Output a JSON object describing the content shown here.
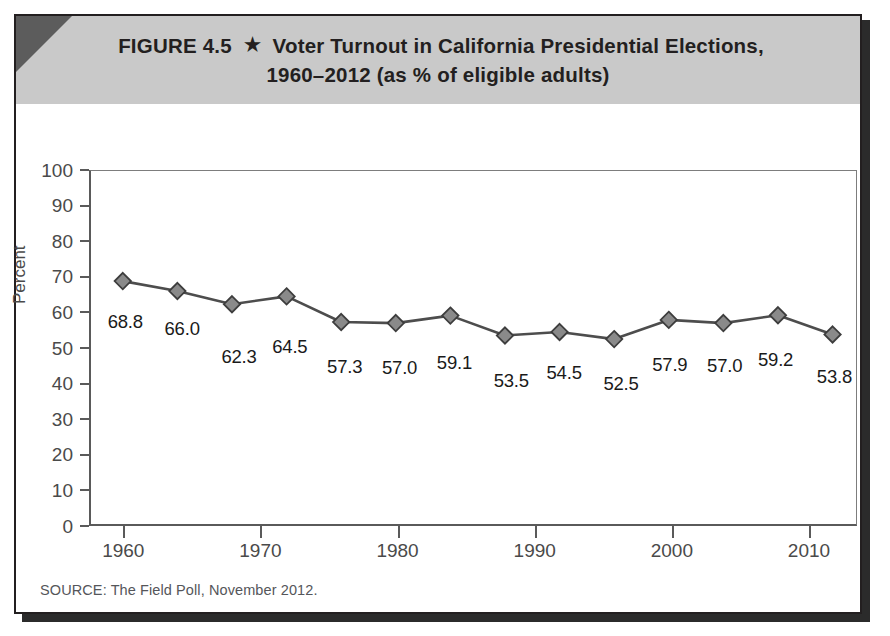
{
  "figure": {
    "title_line1_prefix": "FIGURE 4.5",
    "star_glyph": "★",
    "title_line1_main": "Voter Turnout in California Presidential Elections,",
    "title_line2": "1960–2012 (as % of eligible adults)",
    "source": "SOURCE: The Field Poll, November 2012.",
    "colors": {
      "header_band": "#c9c9c9",
      "corner_accent": "#5c5c5c",
      "border": "#231f20",
      "line": "#4d4d4d",
      "marker_fill": "#8a8a8a",
      "marker_stroke": "#3d3d3d",
      "axis": "#5a5a5a",
      "tick_text": "#4a4a4a",
      "label_text": "#1a1a1a"
    }
  },
  "chart_data": {
    "type": "line",
    "title": "Voter Turnout in California Presidential Elections, 1960–2012 (as % of eligible adults)",
    "xlabel": "",
    "ylabel": "Percent",
    "x": [
      1960,
      1964,
      1968,
      1972,
      1976,
      1980,
      1984,
      1988,
      1992,
      1996,
      2000,
      2004,
      2008,
      2012
    ],
    "values": [
      68.8,
      66.0,
      62.3,
      64.5,
      57.3,
      57.0,
      59.1,
      53.5,
      54.5,
      52.5,
      57.9,
      57.0,
      59.2,
      53.8
    ],
    "point_labels": [
      "68.8",
      "66.0",
      "62.3",
      "64.5",
      "57.3",
      "57.0",
      "59.1",
      "53.5",
      "54.5",
      "52.5",
      "57.9",
      "57.0",
      "59.2",
      "53.8"
    ],
    "ylim": [
      0,
      100
    ],
    "yticks": [
      0,
      10,
      20,
      30,
      40,
      50,
      60,
      70,
      80,
      90,
      100
    ],
    "ytick_labels": [
      "0",
      "10",
      "20",
      "30",
      "40",
      "50",
      "60",
      "70",
      "80",
      "90",
      "100"
    ],
    "xlim": [
      1957.5,
      2013.5
    ],
    "xticks": [
      1960,
      1970,
      1980,
      1990,
      2000,
      2010
    ],
    "xtick_labels": [
      "1960",
      "1970",
      "1980",
      "1990",
      "2000",
      "2010"
    ],
    "grid": false,
    "legend": null,
    "marker": "diamond",
    "series_name": "Voter turnout"
  }
}
